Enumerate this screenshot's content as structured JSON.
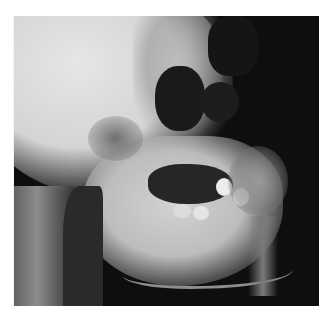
{
  "figure": {
    "type": "radiograph",
    "colors": {
      "background": "#ffffff",
      "bone_light": "#d8d8d8",
      "soft_dark": "#0e0e0e"
    }
  }
}
